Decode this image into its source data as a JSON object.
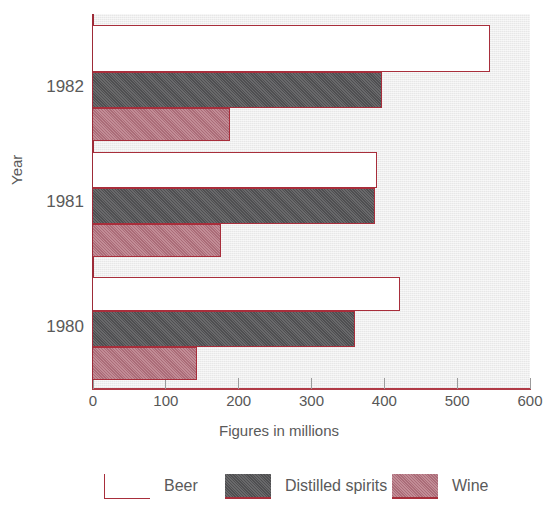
{
  "chart_data": {
    "type": "bar",
    "orientation": "horizontal",
    "title": "",
    "xlabel": "Figures in millions",
    "ylabel": "Year",
    "categories": [
      "1982",
      "1981",
      "1980"
    ],
    "xlim": [
      0,
      600
    ],
    "xticks": [
      0,
      100,
      200,
      300,
      400,
      500,
      600
    ],
    "xtick_labels": [
      "0",
      "100",
      "200",
      "300",
      "400",
      "500",
      "600"
    ],
    "grid": false,
    "legend_position": "bottom",
    "series": [
      {
        "name": "Beer",
        "color": "#ffffff",
        "edge_color": "#a82e3b",
        "values": [
          545,
          390,
          422
        ]
      },
      {
        "name": "Distilled spirits",
        "color": "#58585a",
        "edge_color": "#a82e3b",
        "values": [
          397,
          387,
          360
        ]
      },
      {
        "name": "Wine",
        "color": "#b5737f",
        "edge_color": "#a82e3b",
        "values": [
          188,
          176,
          143
        ]
      }
    ],
    "plot_background": "#e7e7e7"
  },
  "axes": {
    "x_title": "Figures in millions",
    "y_title": "Year",
    "ticks": [
      {
        "label": "0",
        "value": 0
      },
      {
        "label": "100",
        "value": 100
      },
      {
        "label": "200",
        "value": 200
      },
      {
        "label": "300",
        "value": 300
      },
      {
        "label": "400",
        "value": 400
      },
      {
        "label": "500",
        "value": 500
      },
      {
        "label": "600",
        "value": 600
      }
    ],
    "groups": [
      {
        "label": "1982"
      },
      {
        "label": "1981"
      },
      {
        "label": "1980"
      }
    ]
  },
  "legend": {
    "items": [
      {
        "label": "Beer",
        "swatch": "beer-swatch"
      },
      {
        "label": "Distilled spirits",
        "swatch": "spirits-swatch"
      },
      {
        "label": "Wine",
        "swatch": "wine-swatch"
      }
    ]
  },
  "title_sliver": {
    "text": " "
  }
}
